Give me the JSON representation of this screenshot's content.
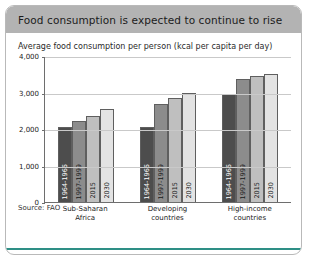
{
  "card": {
    "title": "Food consumption is expected to continue to rise",
    "subtitle": "Average food consumption per person (kcal per capita per day)",
    "source": "Source: FAO",
    "header_color": "#b3b3b3",
    "rule_color": "#2e8f86"
  },
  "chart_data": {
    "type": "bar",
    "title": "Food consumption is expected to continue to rise",
    "subtitle": "Average food consumption per person (kcal per capita per day)",
    "xlabel": "",
    "ylabel": "kcal per capita per day",
    "ylim": [
      0,
      4000
    ],
    "yticks": [
      "0",
      "1,000",
      "2,000",
      "3,000",
      "4,000"
    ],
    "ytick_values": [
      0,
      1000,
      2000,
      3000,
      4000
    ],
    "grid": true,
    "legend": "none",
    "legend_position": "in-bar rotated labels",
    "categories": [
      "Sub-Saharan Africa",
      "Developing countries",
      "High-income countries"
    ],
    "series": [
      {
        "name": "1964-1966",
        "color": "#4d4d4d",
        "values": [
          2060,
          2060,
          2950
        ]
      },
      {
        "name": "1997-1999",
        "color": "#8c8c8c",
        "values": [
          2220,
          2680,
          3380
        ]
      },
      {
        "name": "2015",
        "color": "#bfbfbf",
        "values": [
          2360,
          2850,
          3440
        ]
      },
      {
        "name": "2030",
        "color": "#e3e3e3",
        "values": [
          2540,
          2980,
          3500
        ]
      }
    ],
    "groups": [
      {
        "label_line1": "Sub-Saharan",
        "label_line2": "Africa",
        "bars": [
          {
            "label": "1964-1966",
            "value": 2060,
            "color": "#4d4d4d",
            "dark": true
          },
          {
            "label": "1997-1999",
            "value": 2220,
            "color": "#8c8c8c",
            "dark": false
          },
          {
            "label": "2015",
            "value": 2360,
            "color": "#bfbfbf",
            "dark": false
          },
          {
            "label": "2030",
            "value": 2540,
            "color": "#e3e3e3",
            "dark": false
          }
        ]
      },
      {
        "label_line1": "Developing",
        "label_line2": "countries",
        "bars": [
          {
            "label": "1964-1966",
            "value": 2060,
            "color": "#4d4d4d",
            "dark": true
          },
          {
            "label": "1997-1999",
            "value": 2680,
            "color": "#8c8c8c",
            "dark": false
          },
          {
            "label": "2015",
            "value": 2850,
            "color": "#bfbfbf",
            "dark": false
          },
          {
            "label": "2030",
            "value": 2980,
            "color": "#e3e3e3",
            "dark": false
          }
        ]
      },
      {
        "label_line1": "High-income",
        "label_line2": "countries",
        "bars": [
          {
            "label": "1964-1966",
            "value": 2950,
            "color": "#4d4d4d",
            "dark": true
          },
          {
            "label": "1997-1999",
            "value": 3380,
            "color": "#8c8c8c",
            "dark": false
          },
          {
            "label": "2015",
            "value": 3440,
            "color": "#bfbfbf",
            "dark": false
          },
          {
            "label": "2030",
            "value": 3500,
            "color": "#e3e3e3",
            "dark": false
          }
        ]
      }
    ]
  }
}
